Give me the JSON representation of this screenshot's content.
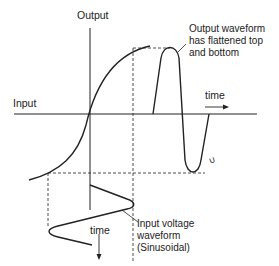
{
  "diagram": {
    "labels": {
      "output_axis": "Output",
      "input_axis": "Input",
      "time_horizontal": "time",
      "time_vertical": "time"
    },
    "annotations": {
      "output_waveform": [
        "Output waveform",
        "has flattened top",
        "and bottom"
      ],
      "input_waveform": [
        "Input voltage",
        "waveform",
        "(Sinusoidal)"
      ]
    },
    "small_mark": "∪",
    "colors": {
      "ink": "#222222",
      "background": "#ffffff"
    }
  }
}
